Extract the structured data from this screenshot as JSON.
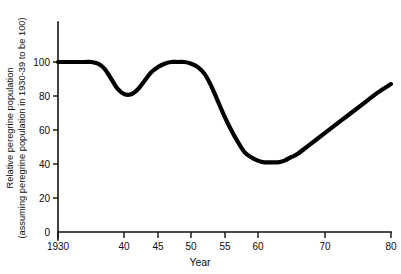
{
  "chart_data": {
    "type": "line",
    "title": "",
    "xlabel": "Year",
    "ylabel_line1": "Relative peregrine population",
    "ylabel_line2": "(assuming peregrine population in 1930-39 to be 100)",
    "xlim": [
      1930,
      1980
    ],
    "ylim": [
      0,
      100
    ],
    "grid": false,
    "legend": "none",
    "x_tick_labels": [
      "1930",
      "40",
      "45",
      "50",
      "55",
      "60",
      "70",
      "80"
    ],
    "x_tick_values": [
      1930,
      1940,
      1945,
      1950,
      1955,
      1960,
      1970,
      1980
    ],
    "y_tick_labels": [
      "0",
      "20",
      "40",
      "60",
      "80",
      "100"
    ],
    "y_tick_values": [
      0,
      20,
      40,
      60,
      80,
      100
    ],
    "series": [
      {
        "name": "Relative peregrine population",
        "color": "#000000",
        "x": [
          1930,
          1932,
          1934,
          1935,
          1936,
          1937,
          1938,
          1939,
          1940,
          1941,
          1942,
          1943,
          1944,
          1945,
          1946,
          1947,
          1948,
          1949,
          1950,
          1951,
          1952,
          1953,
          1954,
          1955,
          1956,
          1957,
          1958,
          1959,
          1960,
          1961,
          1962,
          1963,
          1964,
          1965,
          1966,
          1968,
          1970,
          1972,
          1974,
          1976,
          1978,
          1980
        ],
        "values": [
          100,
          100,
          100,
          100,
          99,
          96,
          90,
          84,
          81,
          81,
          84,
          89,
          94,
          97,
          99,
          100,
          100,
          100,
          99,
          97,
          93,
          86,
          77,
          68,
          60,
          53,
          47,
          44,
          42,
          41,
          41,
          41,
          42,
          44,
          46,
          52,
          58,
          64,
          70,
          76,
          82,
          87
        ]
      }
    ],
    "annotations": {
      "initial_plateau": "100 (1930-39 baseline)",
      "first_dip_min": 81,
      "first_dip_year": 1940,
      "post_war_peak": 100,
      "post_war_peak_year": 1948,
      "crash_min": 41,
      "crash_min_year": 1962,
      "final_value": 87,
      "final_year": 1980
    }
  }
}
